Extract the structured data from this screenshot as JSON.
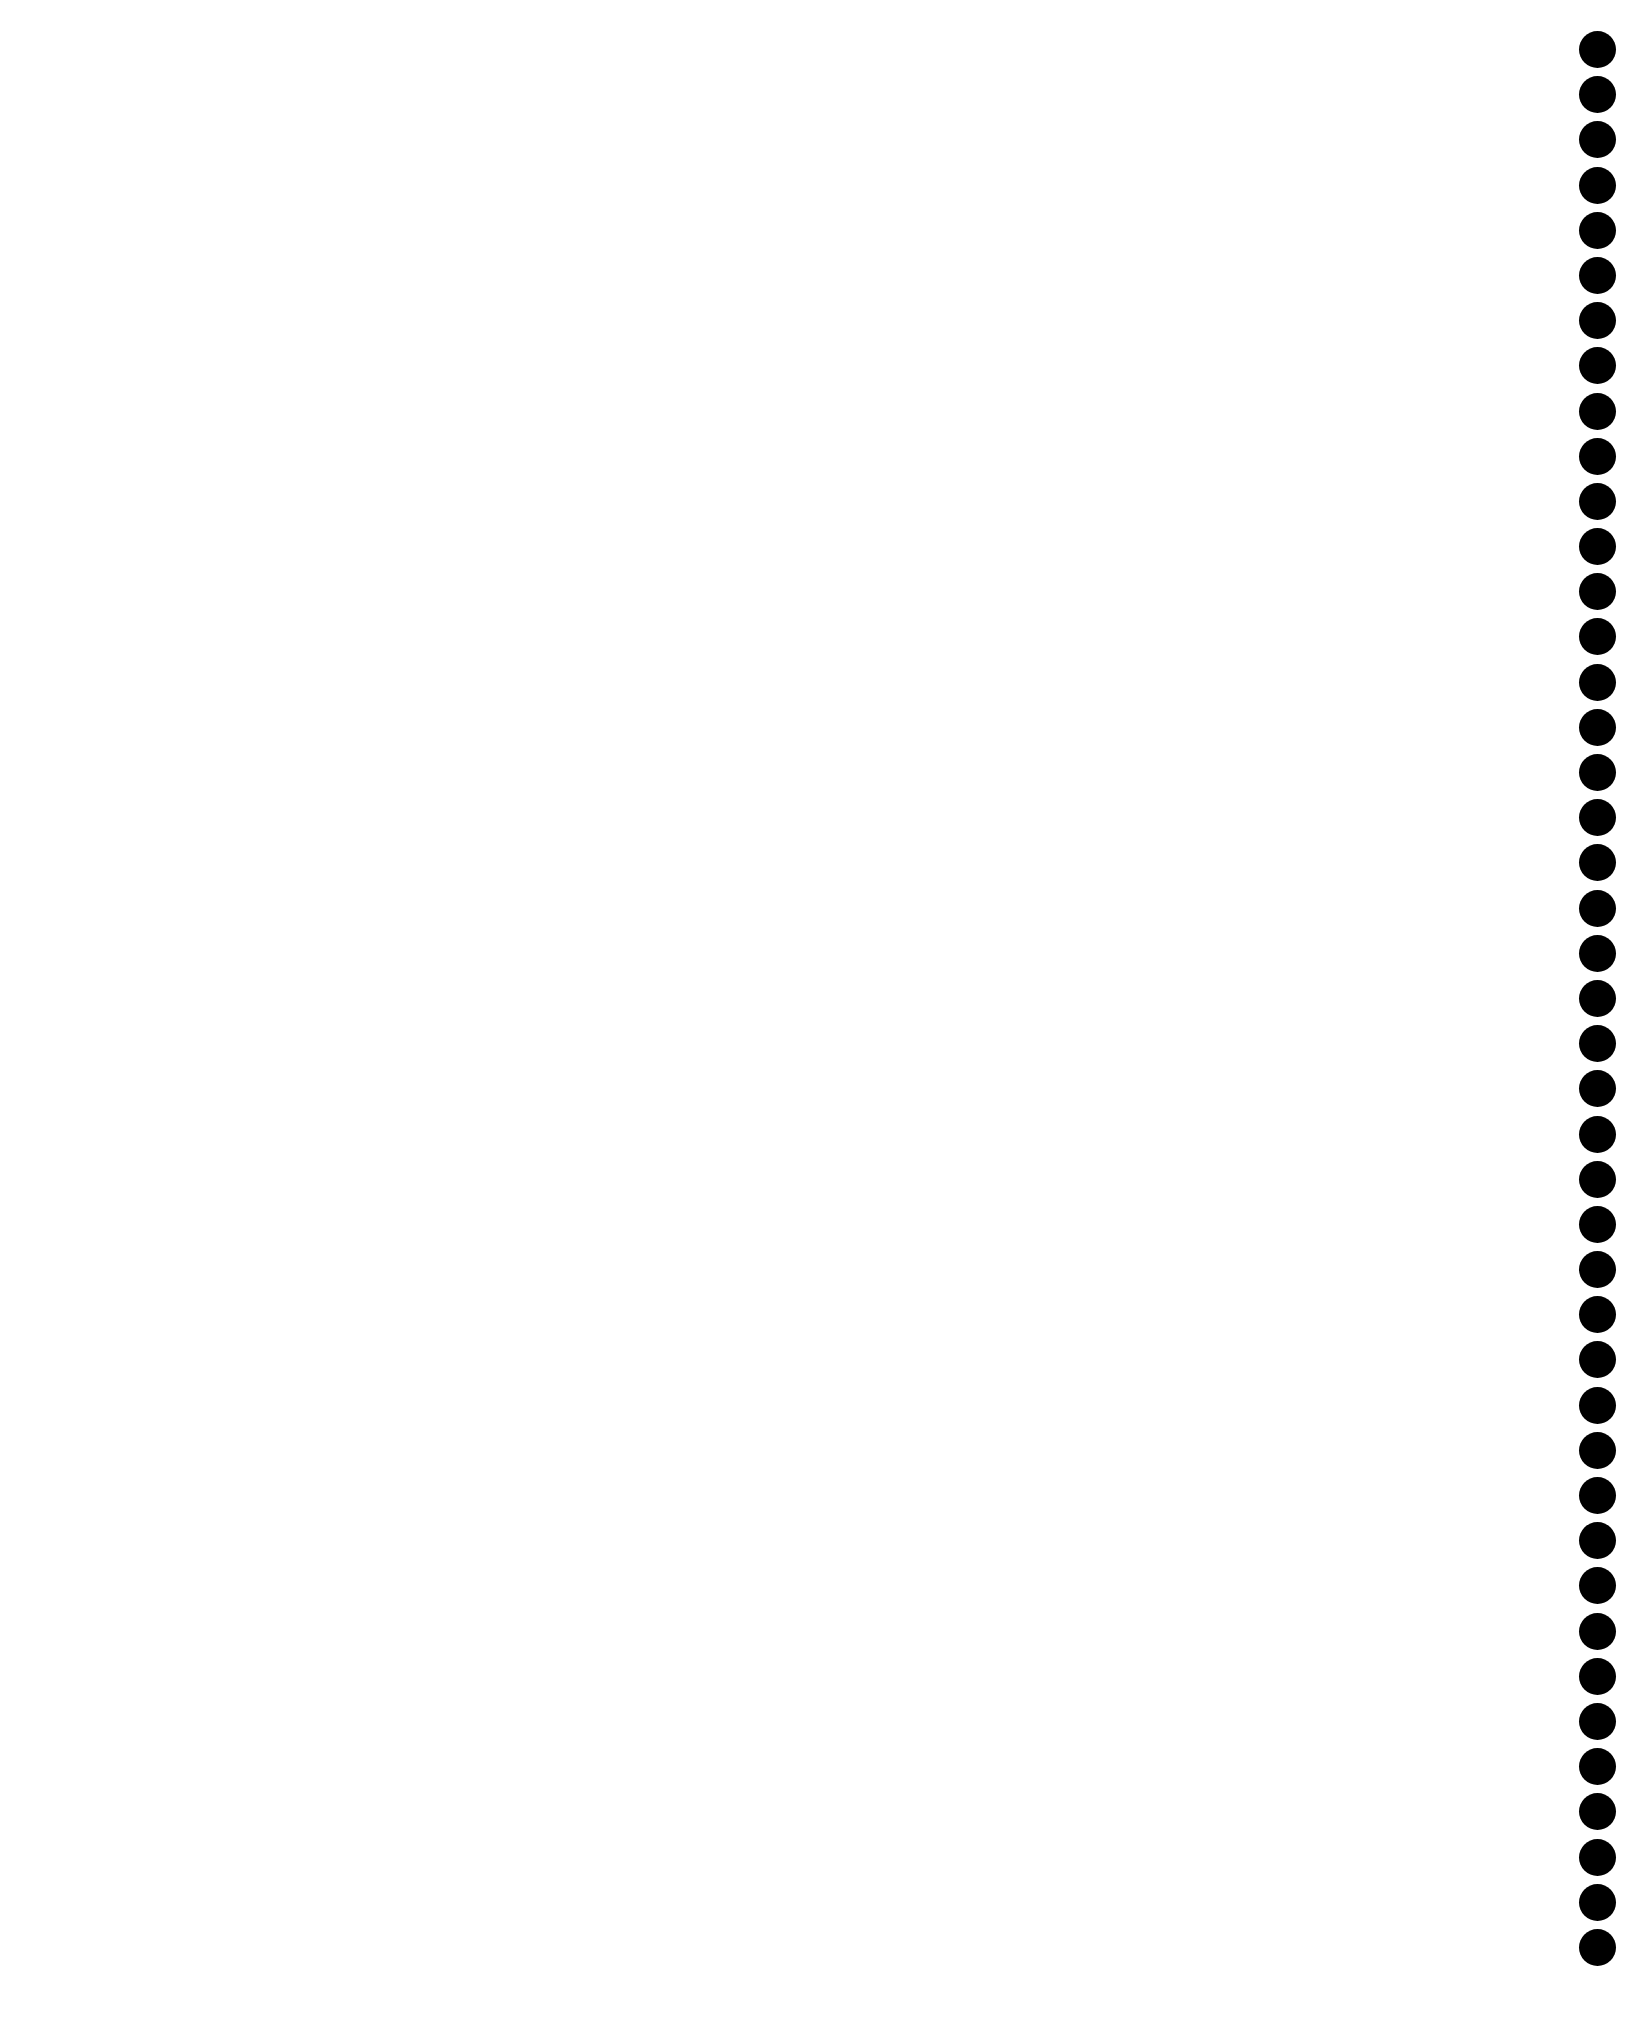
{
  "page": {
    "background_color": "#ffffff",
    "content_text": ""
  },
  "binding": {
    "type": "punched-holes",
    "hole_count": 43,
    "hole_color": "#000000",
    "position": "right-edge"
  }
}
